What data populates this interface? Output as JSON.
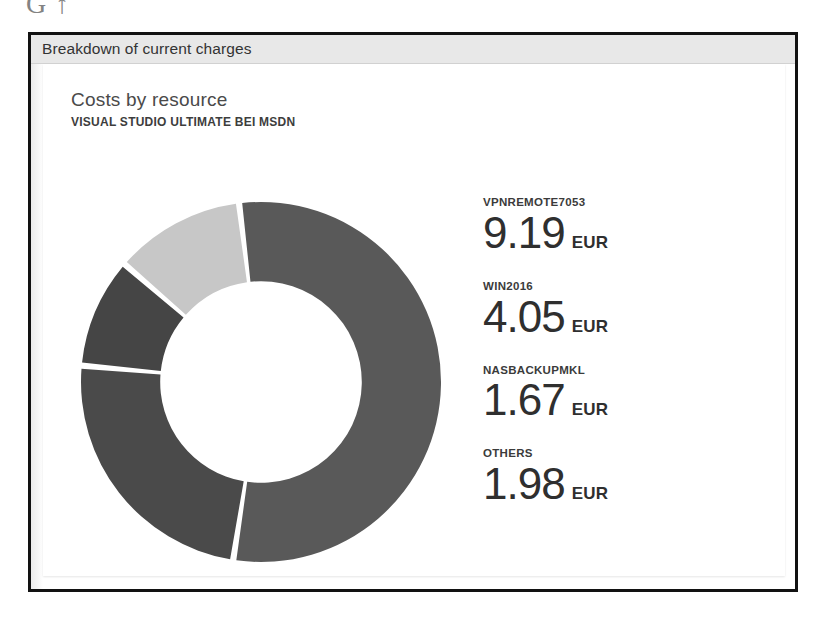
{
  "artifact_text": "G ↑",
  "panel": {
    "header_title": "Breakdown of current charges"
  },
  "card": {
    "title": "Costs by resource",
    "subtitle": "VISUAL STUDIO ULTIMATE BEI MSDN",
    "currency": "EUR"
  },
  "legend": {
    "items": [
      {
        "label": "VPNREMOTE7053",
        "amount": "9.19",
        "currency": "EUR",
        "color": "#595959"
      },
      {
        "label": "WIN2016",
        "amount": "4.05",
        "currency": "EUR",
        "color": "#4a4a4a"
      },
      {
        "label": "NASBACKUPMKL",
        "amount": "1.67",
        "currency": "EUR",
        "color": "#454545"
      },
      {
        "label": "OTHERS",
        "amount": "1.98",
        "currency": "EUR",
        "color": "#c7c7c7"
      }
    ]
  },
  "chart_data": {
    "type": "pie",
    "title": "Costs by resource",
    "subtitle": "VISUAL STUDIO ULTIMATE BEI MSDN",
    "unit": "EUR",
    "donut": true,
    "inner_radius_ratio": 0.56,
    "start_angle_deg": -7,
    "gap_deg": 2,
    "legend_position": "right",
    "grid": false,
    "categories": [
      "VPNREMOTE7053",
      "WIN2016",
      "NASBACKUPMKL",
      "OTHERS"
    ],
    "values": [
      9.19,
      4.05,
      1.67,
      1.98
    ],
    "colors": [
      "#595959",
      "#4a4a4a",
      "#454545",
      "#c7c7c7"
    ],
    "total": 16.89
  }
}
